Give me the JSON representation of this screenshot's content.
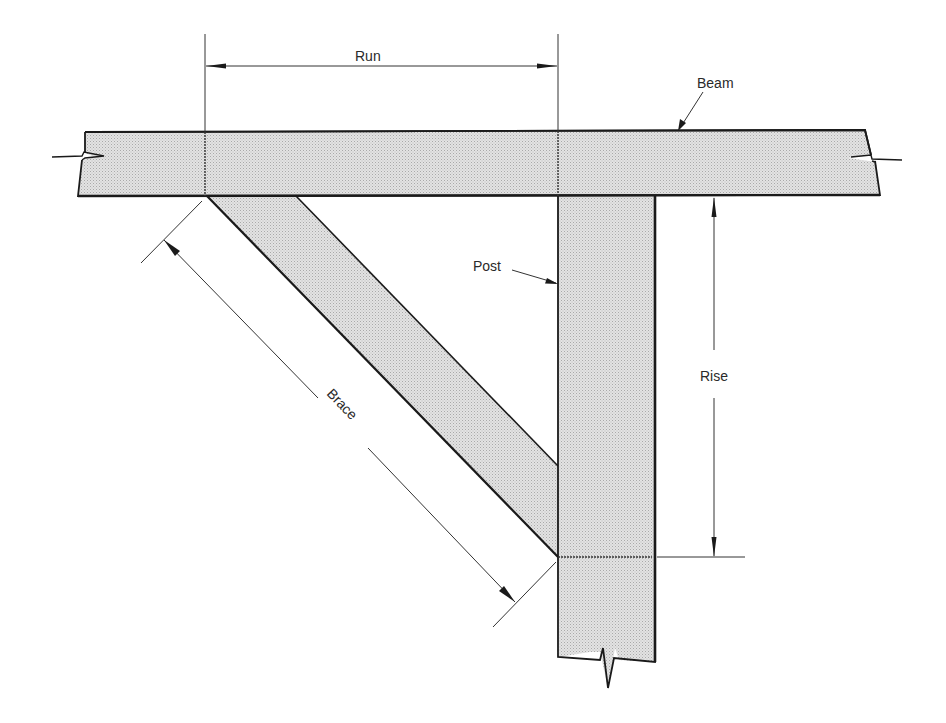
{
  "diagram": {
    "type": "timber-frame knee brace detail",
    "colors": {
      "wood_fill": "#d9d9d9",
      "outline": "#1a1a1a",
      "dimension_line": "#333333",
      "background": "#ffffff"
    },
    "labels": {
      "run": "Run",
      "beam": "Beam",
      "post": "Post",
      "rise": "Rise",
      "brace": "Brace"
    },
    "members": [
      {
        "name": "Beam",
        "orientation": "horizontal"
      },
      {
        "name": "Post",
        "orientation": "vertical"
      },
      {
        "name": "Brace",
        "orientation": "diagonal"
      }
    ],
    "dimensions": [
      {
        "name": "Run",
        "axis": "horizontal"
      },
      {
        "name": "Rise",
        "axis": "vertical"
      },
      {
        "name": "Brace",
        "axis": "diagonal"
      }
    ]
  }
}
